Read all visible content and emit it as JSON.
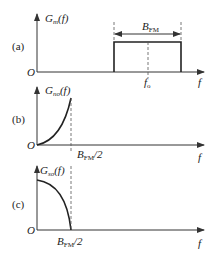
{
  "panels": [
    {
      "id": "a",
      "tag": "(a)",
      "ylabel_main": "G",
      "ylabel_sub": "m",
      "ylabel_arg": "(f)",
      "origin": "O",
      "xlabel": "f",
      "shape": "rectangle band centered at f_o",
      "bandwidth_label_main": "B",
      "bandwidth_label_sub": "FM",
      "center_label_main": "f",
      "center_label_sub": "o"
    },
    {
      "id": "b",
      "tag": "(b)",
      "ylabel_main": "G",
      "ylabel_sub": "no",
      "ylabel_arg": "(f)",
      "origin": "O",
      "xlabel": "f",
      "shape": "rising parabolic curve from 0 to B_FM/2",
      "cutoff_label_main": "B",
      "cutoff_label_sub": "FM",
      "cutoff_label_tail": "/2"
    },
    {
      "id": "c",
      "tag": "(c)",
      "ylabel_main": "G",
      "ylabel_sub": "so",
      "ylabel_arg": "(f)",
      "origin": "O",
      "xlabel": "f",
      "shape": "falling curve from max at 0 to zero at B_FM/2",
      "cutoff_label_main": "B",
      "cutoff_label_sub": "FM",
      "cutoff_label_tail": "/2"
    }
  ]
}
